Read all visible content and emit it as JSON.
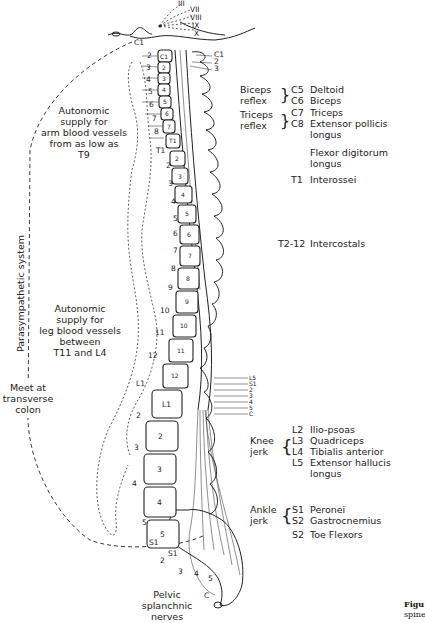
{
  "cranial_nerves": [
    "III",
    "VII",
    "VIII",
    "IX",
    "X"
  ],
  "left_labels": {
    "arm_supply": [
      "Autonomic",
      "supply for",
      "arm blood vessels",
      "from as low as",
      "T9"
    ],
    "leg_supply": [
      "Autonomic",
      "supply for",
      "leg blood vessels",
      "between",
      "T11 and L4"
    ],
    "parasympathetic": "Parasympathetic system",
    "meet": [
      "Meet at",
      "transverse",
      "colon"
    ],
    "pelvic": [
      "Pelvic",
      "splanchnic",
      "nerves"
    ]
  },
  "root_labels_left": {
    "cervical": [
      "C1",
      "2",
      "3",
      "4",
      "5",
      "6",
      "7",
      "8"
    ],
    "thoracic": [
      "T1",
      "2",
      "3",
      "4",
      "5",
      "6",
      "7",
      "8",
      "9",
      "10",
      "11",
      "12"
    ],
    "lumbar": [
      "L1",
      "2",
      "3",
      "4",
      "5"
    ],
    "sacral": [
      "S1",
      "2",
      "3",
      "4",
      "5",
      "C"
    ]
  },
  "vertebra_labels": {
    "cervical": [
      "C1",
      "2",
      "3",
      "4",
      "5",
      "6",
      "7"
    ],
    "thoracic": [
      "T1",
      "2",
      "3",
      "4",
      "5",
      "6",
      "7",
      "8",
      "9",
      "10",
      "11",
      "12"
    ],
    "lumbar": [
      "L1",
      "2",
      "3",
      "4",
      "5"
    ],
    "sacral": "S1"
  },
  "top_right_labels": [
    "C1",
    "2",
    "3"
  ],
  "cauda_labels": [
    "L5",
    "S1",
    "2",
    "3",
    "4",
    "5",
    "C"
  ],
  "reflexes": {
    "biceps": [
      "Biceps",
      "reflex"
    ],
    "triceps": [
      "Triceps",
      "reflex"
    ],
    "knee": [
      "Knee",
      "jerk"
    ],
    "ankle": [
      "Ankle",
      "jerk"
    ]
  },
  "myotomes": [
    {
      "level": "C5",
      "muscle": "Deltoid"
    },
    {
      "level": "C6",
      "muscle": "Biceps"
    },
    {
      "level": "C7",
      "muscle": "Triceps"
    },
    {
      "level": "C8",
      "muscle": "Extensor pollicis",
      "muscle2": "longus"
    },
    {
      "level": "",
      "muscle": "Flexor digitorum",
      "muscle2": "longus"
    },
    {
      "level": "T1",
      "muscle": "Interossei"
    },
    {
      "level": "T2-12",
      "muscle": "Intercostals"
    },
    {
      "level": "L2",
      "muscle": "Ilio-psoas"
    },
    {
      "level": "L3",
      "muscle": "Quadriceps"
    },
    {
      "level": "L4",
      "muscle": "Tibialis anterior"
    },
    {
      "level": "L5",
      "muscle": "Extensor hallucis",
      "muscle2": "longus"
    },
    {
      "level": "S1",
      "muscle": "Peronei"
    },
    {
      "level": "S2",
      "muscle": "Gastrocnemius"
    },
    {
      "level": "S2",
      "muscle": "Toe Flexors"
    }
  ],
  "caption": {
    "bold": "Figu",
    "text": "spine"
  }
}
